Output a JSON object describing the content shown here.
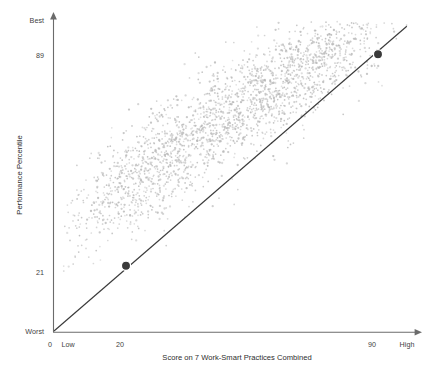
{
  "chart_data": {
    "type": "scatter",
    "title": "",
    "subtitle": "",
    "xlabel": "Score on 7 Work-Smart Practices Combined",
    "ylabel": "Performance Percentile",
    "xlim": [
      0,
      100
    ],
    "ylim": [
      0,
      100
    ],
    "grid": false,
    "legend": null,
    "x_tick_labels": [
      "0",
      "Low",
      "20",
      "90",
      "High"
    ],
    "y_tick_labels": [
      "Best",
      "89",
      "21",
      "Worst"
    ],
    "x_ticks": [
      {
        "label": "0",
        "value": 0
      },
      {
        "label": "Low",
        "value": 3
      },
      {
        "label": "20",
        "value": 20
      },
      {
        "label": "90",
        "value": 90
      },
      {
        "label": "High",
        "value": 98
      }
    ],
    "y_ticks": [
      {
        "label": "Best",
        "value": 100
      },
      {
        "label": "89",
        "value": 89
      },
      {
        "label": "21",
        "value": 21
      },
      {
        "label": "Worst",
        "value": 0
      }
    ],
    "trendline": {
      "type": "linear",
      "points": [
        [
          0,
          0
        ],
        [
          98,
          98
        ]
      ],
      "color": "#3a3a3a"
    },
    "highlighted_points": [
      {
        "x": 20,
        "y": 21,
        "label": "20 / 21"
      },
      {
        "x": 90,
        "y": 89,
        "label": "90 / 89"
      }
    ],
    "series": [
      {
        "name": "employees",
        "color": "#b9b9b9",
        "n_points": 2200,
        "correlation": 0.82,
        "description": "dense cloud along the 1:1 diagonal, sparse in upper-left and lower-right corners"
      }
    ]
  },
  "axis": {
    "y_title": "Performance Percentile",
    "x_title": "Score on 7 Work-Smart Practices Combined",
    "y_best": "Best",
    "y_89": "89",
    "y_21": "21",
    "y_worst": "Worst",
    "x_zero": "0",
    "x_low": "Low",
    "x_20": "20",
    "x_90": "90",
    "x_high": "High"
  },
  "colors": {
    "point": "#b9b9b9",
    "highlight": "#3a3a3a",
    "axis": "#6b6b6b",
    "trend": "#3a3a3a",
    "text": "#3f3f3f",
    "background": "#ffffff"
  }
}
